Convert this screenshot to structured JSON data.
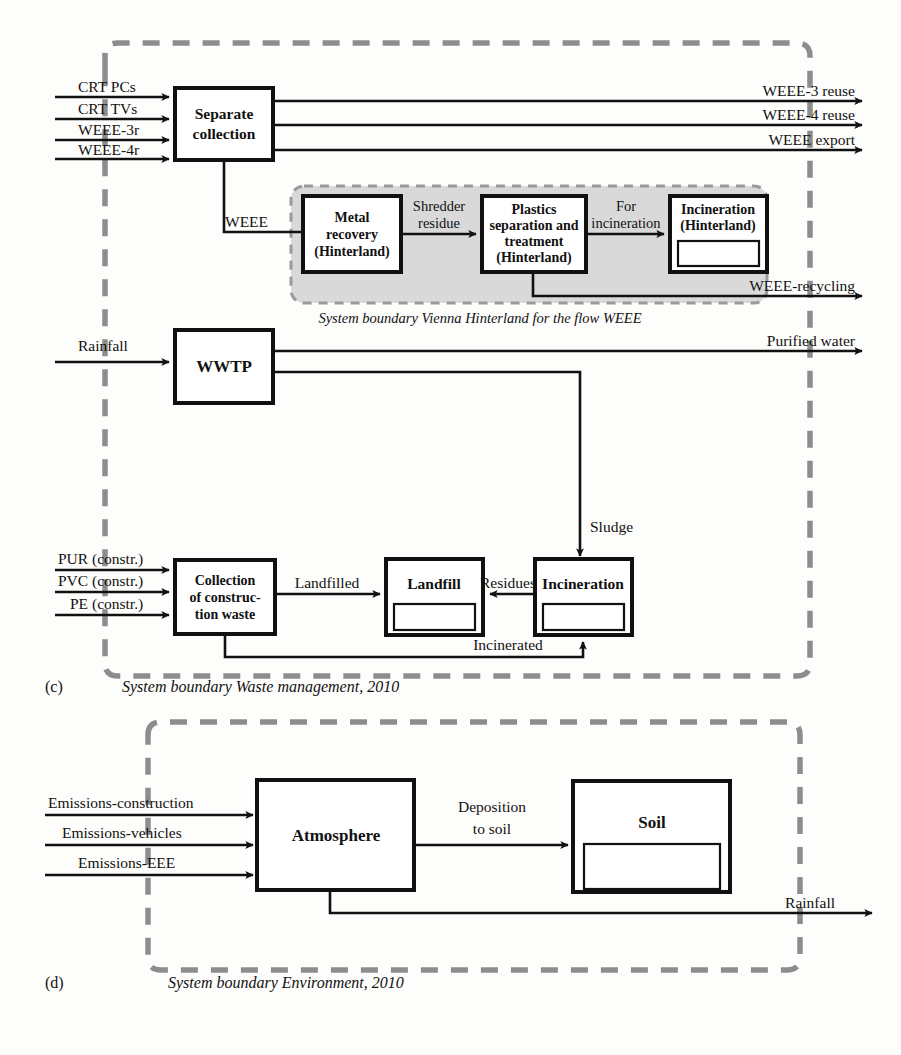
{
  "figure": {
    "type": "material-flow-analysis-diagram",
    "panels": [
      {
        "id": "(c)",
        "caption": "System boundary Waste management, 2010",
        "inner_caption": "System boundary Vienna Hinterland for the flow WEEE"
      },
      {
        "id": "(d)",
        "caption": "System boundary Environment, 2010"
      }
    ]
  },
  "panel_c": {
    "id_label": "(c)",
    "caption": "System boundary Waste management, 2010",
    "hinterland_caption": "System boundary Vienna Hinterland for the flow WEEE",
    "inputs": [
      "CRT PCs",
      "CRT TVs",
      "WEEE-3r",
      "WEEE-4r",
      "Rainfall",
      "PUR (constr.)",
      "PVC (constr.)",
      "PE (constr.)"
    ],
    "outputs": [
      "WEEE-3 reuse",
      "WEEE-4 reuse",
      "WEEE export",
      "WEEE-recycling",
      "Purified water"
    ],
    "processes": [
      {
        "name": "separate-collection",
        "lines": [
          "Separate",
          "collection"
        ],
        "stock": false
      },
      {
        "name": "metal-recovery",
        "lines": [
          "Metal",
          "recovery",
          "(Hinterland)"
        ],
        "stock": false
      },
      {
        "name": "plastics-separation",
        "lines": [
          "Plastics",
          "separation and",
          "treatment",
          "(Hinterland)"
        ],
        "stock": false
      },
      {
        "name": "incineration-hinterland",
        "lines": [
          "Incineration",
          "(Hinterland)"
        ],
        "stock": true
      },
      {
        "name": "wwtp",
        "lines": [
          "WWTP"
        ],
        "stock": false
      },
      {
        "name": "collection-construction-waste",
        "lines": [
          "Collection",
          "of construc-",
          "tion waste"
        ],
        "stock": false
      },
      {
        "name": "landfill",
        "lines": [
          "Landfill"
        ],
        "stock": true
      },
      {
        "name": "incineration",
        "lines": [
          "Incineration"
        ],
        "stock": true
      }
    ],
    "flow_labels": [
      "WEEE",
      "Shredder residue",
      "For incineration",
      "Sludge",
      "Landfilled",
      "Residues",
      "Incinerated"
    ],
    "box_separate_collection": {
      "l1": "Separate",
      "l2": "collection"
    },
    "box_metal_recovery": {
      "l1": "Metal",
      "l2": "recovery",
      "l3": "(Hinterland)"
    },
    "box_plastics": {
      "l1": "Plastics",
      "l2": "separation and",
      "l3": "treatment",
      "l4": "(Hinterland)"
    },
    "box_incineration_hinterland": {
      "l1": "Incineration",
      "l2": "(Hinterland)"
    },
    "box_wwtp": {
      "l1": "WWTP"
    },
    "box_collection_constr": {
      "l1": "Collection",
      "l2": "of construc-",
      "l3": "tion waste"
    },
    "box_landfill": {
      "l1": "Landfill"
    },
    "box_incineration": {
      "l1": "Incineration"
    },
    "in_crt_pcs": "CRT PCs",
    "in_crt_tvs": "CRT TVs",
    "in_weee3r": "WEEE-3r",
    "in_weee4r": "WEEE-4r",
    "in_rainfall": "Rainfall",
    "in_pur": "PUR (constr.)",
    "in_pvc": "PVC (constr.)",
    "in_pe": "PE (constr.)",
    "out_weee3_reuse": "WEEE-3 reuse",
    "out_weee4_reuse": "WEEE-4 reuse",
    "out_weee_export": "WEEE export",
    "out_weee_recycling": "WEEE-recycling",
    "out_purified_water": "Purified water",
    "fl_weee": "WEEE",
    "fl_shredder_1": "Shredder",
    "fl_shredder_2": "residue",
    "fl_for_1": "For",
    "fl_for_2": "incineration",
    "fl_sludge": "Sludge",
    "fl_landfilled": "Landfilled",
    "fl_residues": "Residues",
    "fl_incinerated": "Incinerated"
  },
  "panel_d": {
    "id_label": "(d)",
    "caption": "System boundary Environment, 2010",
    "inputs": [
      "Emissions-construction",
      "Emissions-vehicles",
      "Emissions-EEE"
    ],
    "outputs": [
      "Rainfall"
    ],
    "processes": [
      {
        "name": "atmosphere",
        "lines": [
          "Atmosphere"
        ],
        "stock": false
      },
      {
        "name": "soil",
        "lines": [
          "Soil"
        ],
        "stock": true
      }
    ],
    "flow_labels": [
      "Deposition to soil"
    ],
    "in_emissions_construction": "Emissions-construction",
    "in_emissions_vehicles": "Emissions-vehicles",
    "in_emissions_eee": "Emissions-EEE",
    "box_atmosphere": {
      "l1": "Atmosphere"
    },
    "box_soil": {
      "l1": "Soil"
    },
    "fl_deposition_1": "Deposition",
    "fl_deposition_2": "to soil",
    "out_rainfall": "Rainfall"
  },
  "colors": {
    "line": "#111111",
    "boundary_dash": "#8d8d8d",
    "hinterland_fill": "#d9d9d9",
    "background": "#fdfdfb"
  }
}
